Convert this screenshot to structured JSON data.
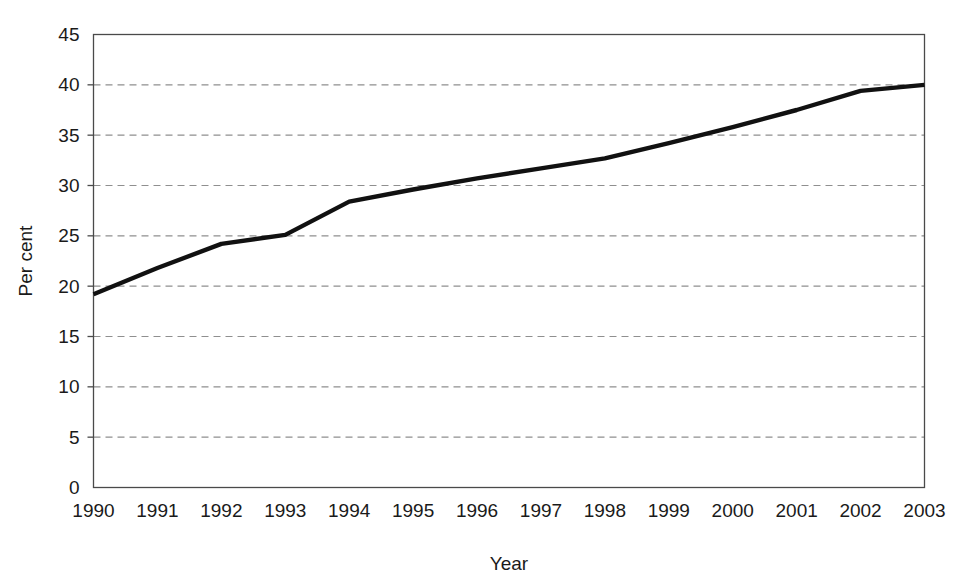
{
  "chart_data": {
    "type": "line",
    "title": "",
    "subtitle": "",
    "xlabel": "Year",
    "ylabel": "Per cent",
    "categories": [
      "1990",
      "1991",
      "1992",
      "1993",
      "1994",
      "1995",
      "1996",
      "1997",
      "1998",
      "1999",
      "2000",
      "2001",
      "2002",
      "2003"
    ],
    "x": [
      1990,
      1991,
      1992,
      1993,
      1994,
      1995,
      1996,
      1997,
      1998,
      1999,
      2000,
      2001,
      2002,
      2003
    ],
    "values": [
      19.2,
      21.8,
      24.2,
      25.1,
      28.4,
      29.6,
      30.7,
      31.7,
      32.7,
      34.2,
      35.8,
      37.5,
      39.4,
      40.0
    ],
    "series": [
      {
        "name": "Per cent",
        "values": [
          19.2,
          21.8,
          24.2,
          25.1,
          28.4,
          29.6,
          30.7,
          31.7,
          32.7,
          34.2,
          35.8,
          37.5,
          39.4,
          40.0
        ],
        "color": "#111111"
      }
    ],
    "ylim": [
      0,
      45
    ],
    "ytick_values": [
      0,
      5,
      10,
      15,
      20,
      25,
      30,
      35,
      40,
      45
    ],
    "ytick_labels": [
      "0",
      "5",
      "10",
      "15",
      "20",
      "25",
      "30",
      "35",
      "40",
      "45"
    ],
    "xtick_labels": [
      "1990",
      "1991",
      "1992",
      "1993",
      "1994",
      "1995",
      "1996",
      "1997",
      "1998",
      "1999",
      "2000",
      "2001",
      "2002",
      "2003"
    ],
    "grid": true,
    "grid_axis": "y",
    "grid_style": "dashed",
    "grid_color": "#8f8f8f",
    "legend": false,
    "legend_position": "none",
    "annotations": [],
    "line_color": "#111111",
    "frame_color": "#4a4a4a",
    "background_color": "#ffffff"
  }
}
